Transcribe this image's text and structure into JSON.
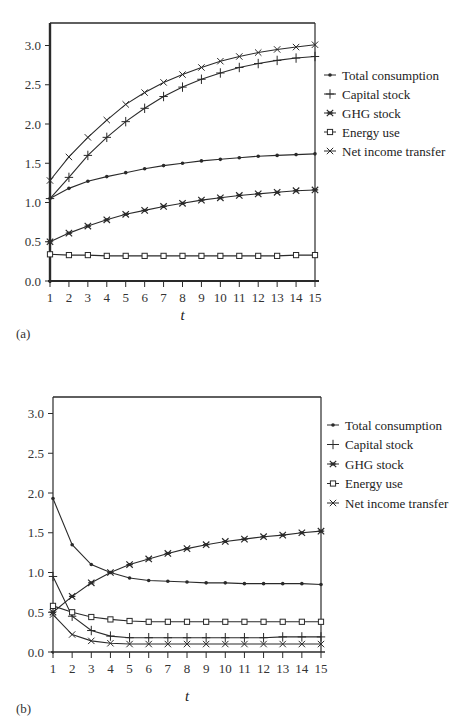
{
  "chart_data": [
    {
      "type": "line",
      "panel_label": "(a)",
      "title": "",
      "xlabel": "t",
      "ylabel": "",
      "x": [
        1,
        2,
        3,
        4,
        5,
        6,
        7,
        8,
        9,
        10,
        11,
        12,
        13,
        14,
        15
      ],
      "x_tick_labels": [
        "1",
        "2",
        "3",
        "4",
        "5",
        "6",
        "7",
        "8",
        "9",
        "10",
        "11",
        "12",
        "13",
        "14",
        "15"
      ],
      "y_tick_labels": [
        "0.0",
        "0.5",
        "1.0",
        "1.5",
        "2.0",
        "2.5",
        "3.0"
      ],
      "ylim": [
        0,
        3.2
      ],
      "grid": false,
      "legend_position": "right",
      "series": [
        {
          "name": "Total consumption",
          "marker": "dot",
          "values": [
            1.05,
            1.18,
            1.27,
            1.33,
            1.38,
            1.43,
            1.47,
            1.5,
            1.53,
            1.55,
            1.57,
            1.59,
            1.6,
            1.61,
            1.62
          ]
        },
        {
          "name": "Capital stock",
          "marker": "plus",
          "values": [
            1.05,
            1.32,
            1.6,
            1.83,
            2.03,
            2.2,
            2.35,
            2.47,
            2.57,
            2.65,
            2.72,
            2.77,
            2.81,
            2.84,
            2.86
          ]
        },
        {
          "name": "GHG stock",
          "marker": "asterisk",
          "values": [
            0.5,
            0.61,
            0.7,
            0.78,
            0.85,
            0.9,
            0.95,
            0.99,
            1.03,
            1.06,
            1.09,
            1.11,
            1.13,
            1.15,
            1.16
          ]
        },
        {
          "name": "Energy use",
          "marker": "square",
          "values": [
            0.34,
            0.33,
            0.33,
            0.32,
            0.32,
            0.32,
            0.32,
            0.32,
            0.32,
            0.32,
            0.32,
            0.32,
            0.32,
            0.33,
            0.33
          ]
        },
        {
          "name": "Net income transfer",
          "marker": "cross",
          "values": [
            1.28,
            1.58,
            1.83,
            2.05,
            2.25,
            2.4,
            2.53,
            2.63,
            2.72,
            2.8,
            2.86,
            2.91,
            2.95,
            2.98,
            3.01
          ]
        }
      ]
    },
    {
      "type": "line",
      "panel_label": "(b)",
      "title": "",
      "xlabel": "t",
      "ylabel": "",
      "x": [
        1,
        2,
        3,
        4,
        5,
        6,
        7,
        8,
        9,
        10,
        11,
        12,
        13,
        14,
        15
      ],
      "x_tick_labels": [
        "1",
        "2",
        "3",
        "4",
        "5",
        "6",
        "7",
        "8",
        "9",
        "10",
        "11",
        "12",
        "13",
        "14",
        "15"
      ],
      "y_tick_labels": [
        "0.0",
        "0.5",
        "1.0",
        "1.5",
        "2.0",
        "2.5",
        "3.0"
      ],
      "ylim": [
        0,
        3.2
      ],
      "grid": false,
      "legend_position": "right",
      "series": [
        {
          "name": "Total consumption",
          "marker": "dot",
          "values": [
            1.93,
            1.35,
            1.1,
            1.0,
            0.93,
            0.9,
            0.89,
            0.88,
            0.87,
            0.87,
            0.86,
            0.86,
            0.86,
            0.86,
            0.85
          ]
        },
        {
          "name": "Capital stock",
          "marker": "plus",
          "values": [
            0.95,
            0.45,
            0.27,
            0.2,
            0.18,
            0.18,
            0.18,
            0.18,
            0.18,
            0.18,
            0.18,
            0.18,
            0.19,
            0.19,
            0.19
          ]
        },
        {
          "name": "GHG stock",
          "marker": "asterisk",
          "values": [
            0.5,
            0.7,
            0.87,
            1.0,
            1.1,
            1.17,
            1.24,
            1.3,
            1.35,
            1.39,
            1.42,
            1.45,
            1.47,
            1.5,
            1.52
          ]
        },
        {
          "name": "Energy use",
          "marker": "square",
          "values": [
            0.58,
            0.5,
            0.44,
            0.41,
            0.39,
            0.38,
            0.38,
            0.38,
            0.38,
            0.38,
            0.38,
            0.38,
            0.38,
            0.38,
            0.38
          ]
        },
        {
          "name": "Net income transfer",
          "marker": "cross",
          "values": [
            0.47,
            0.22,
            0.14,
            0.11,
            0.1,
            0.1,
            0.1,
            0.1,
            0.1,
            0.1,
            0.1,
            0.1,
            0.1,
            0.1,
            0.1
          ]
        }
      ]
    }
  ],
  "layout": {
    "line_color": "#2a2a2a",
    "text_color": "#222222",
    "background": "#ffffff"
  }
}
